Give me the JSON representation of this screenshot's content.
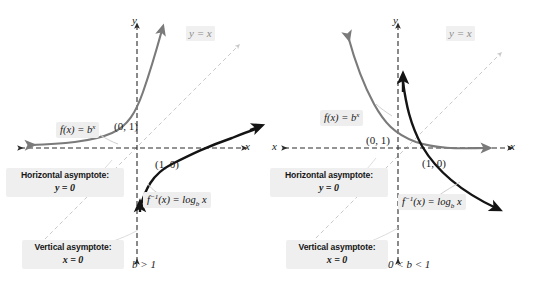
{
  "figure": {
    "colors": {
      "exponential_curve": "#7a7a7a",
      "logarithm_curve": "#141414",
      "axis": "#2b2b2b",
      "identity_line": "#c9c9c9",
      "label_box": "#efefef",
      "background": "#ffffff"
    }
  },
  "chart_data": {
    "type": "line",
    "panels": [
      {
        "name": "b-greater-than-one",
        "condition": "b > 1",
        "xlabel": "x",
        "ylabel": "y",
        "grid": false,
        "axis_style": "dashed-with-arrows",
        "xlim": [
          -3.2,
          3.2
        ],
        "ylim": [
          -3.2,
          3.2
        ],
        "series": [
          {
            "name": "f(x) = b^x",
            "kind": "exponential",
            "color": "#7a7a7a",
            "increasing": true,
            "points": [
              [
                -3,
                0.125
              ],
              [
                -2,
                0.25
              ],
              [
                -1,
                0.5
              ],
              [
                0,
                1
              ],
              [
                1,
                2
              ],
              [
                1.6,
                3.03
              ]
            ],
            "asymptote": "y = 0",
            "key_point": "(0, 1)"
          },
          {
            "name": "f^-1(x) = log_b x",
            "kind": "logarithm",
            "color": "#141414",
            "increasing": true,
            "points": [
              [
                0.125,
                -3
              ],
              [
                0.25,
                -2
              ],
              [
                0.5,
                -1
              ],
              [
                1,
                0
              ],
              [
                2,
                1
              ],
              [
                3.03,
                1.6
              ]
            ],
            "asymptote": "x = 0",
            "key_point": "(1, 0)"
          },
          {
            "name": "y = x",
            "kind": "identity",
            "color": "#c9c9c9",
            "style": "dashed"
          }
        ],
        "annotations": [
          "Horizontal asymptote: y = 0",
          "Vertical asymptote: x = 0"
        ]
      },
      {
        "name": "b-between-zero-and-one",
        "condition": "0 < b < 1",
        "xlabel": "x",
        "ylabel": "y",
        "grid": false,
        "axis_style": "dashed-with-arrows",
        "xlim": [
          -3.2,
          3.2
        ],
        "ylim": [
          -3.2,
          3.2
        ],
        "series": [
          {
            "name": "f(x) = b^x",
            "kind": "exponential",
            "color": "#7a7a7a",
            "increasing": false,
            "points": [
              [
                -1.6,
                3.03
              ],
              [
                -1,
                2
              ],
              [
                0,
                1
              ],
              [
                1,
                0.5
              ],
              [
                2,
                0.25
              ],
              [
                3,
                0.125
              ]
            ],
            "asymptote": "y = 0",
            "key_point": "(0, 1)"
          },
          {
            "name": "f^-1(x) = log_b x",
            "kind": "logarithm",
            "color": "#141414",
            "increasing": false,
            "points": [
              [
                0.125,
                3
              ],
              [
                0.25,
                2
              ],
              [
                0.5,
                1
              ],
              [
                1,
                0
              ],
              [
                2,
                -1
              ],
              [
                3.03,
                -1.6
              ]
            ],
            "asymptote": "x = 0",
            "key_point": "(1, 0)"
          },
          {
            "name": "y = x",
            "kind": "identity",
            "color": "#c9c9c9",
            "style": "dashed"
          }
        ],
        "annotations": [
          "Horizontal asymptote: y = 0",
          "Vertical asymptote: x = 0"
        ]
      }
    ]
  },
  "left": {
    "axis_x": "x",
    "axis_y": "y",
    "identity_label": "y = x",
    "exp_label_html": "f(x) = b<sup>x</sup>",
    "log_label_html": "f<sup>−1</sup>(x) = log<sub>b</sub> x",
    "point_0_1": "(0, 1)",
    "point_1_0": "(1, 0)",
    "horizontal_asymptote_title": "Horizontal asymptote:",
    "horizontal_asymptote_eq": "y = 0",
    "vertical_asymptote_title": "Vertical asymptote:",
    "vertical_asymptote_eq": "x = 0",
    "condition": "b > 1"
  },
  "right": {
    "axis_x": "x",
    "axis_y": "y",
    "axis_x_left": "x",
    "identity_label": "y = x",
    "exp_label_html": "f(x) = b<sup>x</sup>",
    "log_label_html": "f<sup>−1</sup>(x) = log<sub>b</sub> x",
    "point_0_1": "(0, 1)",
    "point_1_0": "(1, 0)",
    "horizontal_asymptote_title": "Horizontal asymptote:",
    "horizontal_asymptote_eq": "y = 0",
    "vertical_asymptote_title": "Vertical asymptote:",
    "vertical_asymptote_eq": "x = 0",
    "condition": "0 < b < 1"
  }
}
